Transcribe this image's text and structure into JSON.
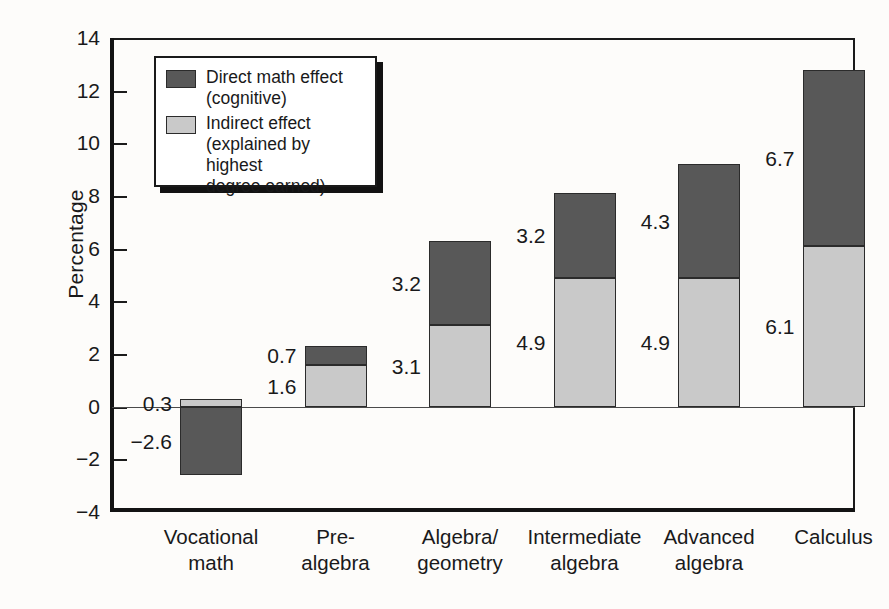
{
  "chart_data": {
    "type": "bar",
    "subtype": "stacked-bar",
    "title": "",
    "xlabel": "",
    "ylabel": "Percentage",
    "ylim": [
      -4,
      14
    ],
    "ytick_step": 2,
    "yticks": [
      "14",
      "12",
      "10",
      "8",
      "6",
      "4",
      "2",
      "0",
      "-2",
      "-4"
    ],
    "grid": false,
    "legend_position": "upper-left-inside",
    "categories": [
      "Vocational\nmath",
      "Pre-\nalgebra",
      "Algebra/\ngeometry",
      "Intermediate\nalgebra",
      "Advanced\nalgebra",
      "Calculus"
    ],
    "series": [
      {
        "name": "Indirect effect (explained by highest degree earned)",
        "short_name": "Indirect effect",
        "color": "#c9c9c9",
        "values": [
          0.3,
          1.6,
          3.1,
          4.9,
          4.9,
          6.1
        ],
        "labels": [
          "0.3",
          "1.6",
          "3.1",
          "4.9",
          "4.9",
          "6.1"
        ]
      },
      {
        "name": "Direct math effect (cognitive)",
        "short_name": "Direct math effect",
        "color": "#585858",
        "values": [
          -2.6,
          0.7,
          3.2,
          3.2,
          4.3,
          6.7
        ],
        "labels": [
          "-2.6",
          "0.7",
          "3.2",
          "3.2",
          "4.3",
          "6.7"
        ]
      }
    ],
    "totals": [
      -2.3,
      2.3,
      6.3,
      8.1,
      9.2,
      12.8
    ]
  },
  "legend": {
    "entries": [
      {
        "swatch": "dark",
        "text": "Direct math effect\n(cognitive)"
      },
      {
        "swatch": "light",
        "text": "Indirect effect\n(explained by highest\ndegree earned)"
      }
    ]
  },
  "colors": {
    "direct": "#585858",
    "indirect": "#c9c9c9",
    "axis": "#1a1a1a",
    "text": "#19191a",
    "background": "#fdfcfa"
  }
}
